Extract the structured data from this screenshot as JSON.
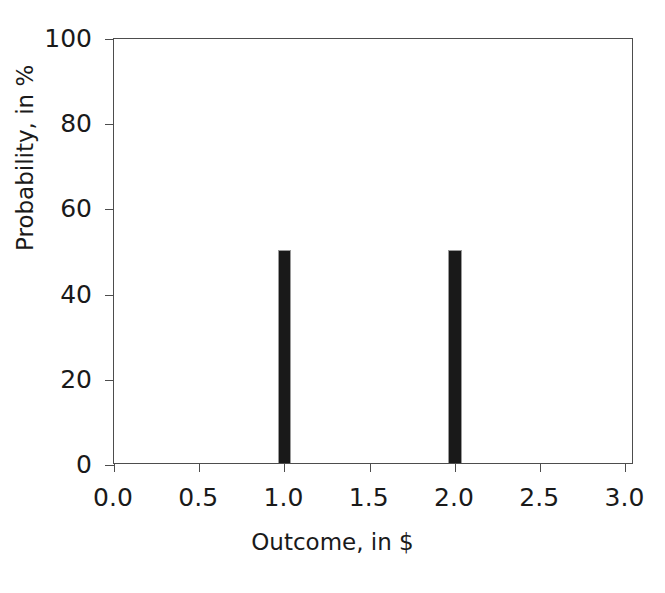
{
  "chart_data": {
    "type": "bar",
    "title": "",
    "xlabel": "Outcome, in $",
    "ylabel": "Probability, in %",
    "x": [
      1.0,
      2.0
    ],
    "values": [
      50,
      50
    ],
    "categories": [
      "1.0",
      "2.0"
    ],
    "series": [
      {
        "name": "Probability",
        "values": [
          50,
          50
        ]
      }
    ],
    "xlim": [
      0.0,
      3.05
    ],
    "ylim": [
      0,
      100
    ],
    "xticks": [
      0.0,
      0.5,
      1.0,
      1.5,
      2.0,
      2.5,
      3.0
    ],
    "xticklabels": [
      "0.0",
      "0.5",
      "1.0",
      "1.5",
      "2.0",
      "2.5",
      "3.0"
    ],
    "yticks": [
      0,
      20,
      40,
      60,
      80,
      100
    ],
    "yticklabels": [
      "0",
      "20",
      "40",
      "60",
      "80",
      "100"
    ],
    "grid": false,
    "legend": false,
    "bar_width": 0.078,
    "bar_color": "#191919",
    "bar_edge_color": "#9a9a9a",
    "axis_color": "#4d4d4d",
    "background_color": "#ffffff",
    "tick_direction": "out"
  }
}
